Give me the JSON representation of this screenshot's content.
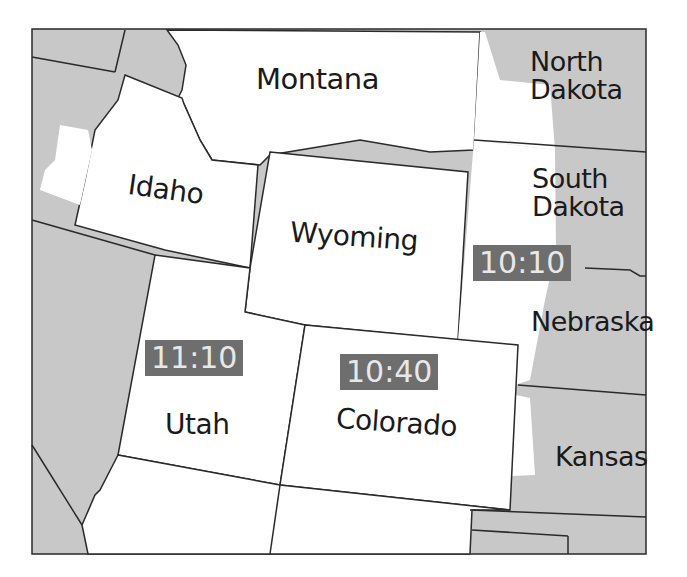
{
  "map": {
    "colors": {
      "highlight_fill": "#ffffff",
      "other_fill": "#c8c8c8",
      "border": "#2a2a2a",
      "badge_bg": "#6e6e6e",
      "badge_text": "#e8e8e8"
    },
    "states": [
      {
        "name": "Montana"
      },
      {
        "name": "North Dakota",
        "line1": "North",
        "line2": "Dakota"
      },
      {
        "name": "Idaho"
      },
      {
        "name": "Wyoming"
      },
      {
        "name": "South Dakota",
        "line1": "South",
        "line2": "Dakota"
      },
      {
        "name": "Nebraska"
      },
      {
        "name": "Utah"
      },
      {
        "name": "Colorado"
      },
      {
        "name": "Kansas"
      }
    ],
    "times": [
      {
        "region": "Utah",
        "value": "11:10"
      },
      {
        "region": "Colorado",
        "value": "10:40"
      },
      {
        "region": "South Dakota / Nebraska",
        "value": "10:10"
      }
    ]
  }
}
